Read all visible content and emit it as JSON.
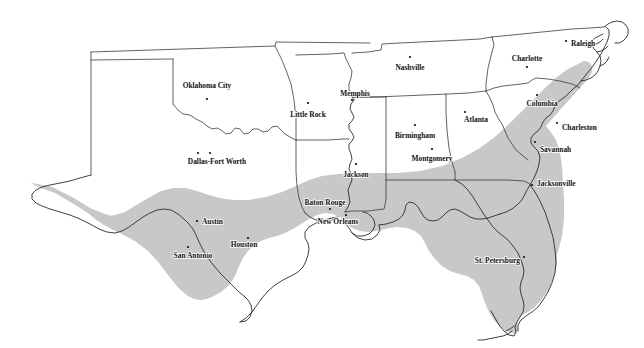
{
  "figure": {
    "type": "reference-map",
    "title_clipped": "partially visible cut-off caption line at top edge",
    "background_color": "#ffffff",
    "shade_color": "#c8c8c8",
    "outline_color": "#3b3b3b",
    "coast_color": "#2c2c2c",
    "label_color": "#111111",
    "region_name": "shaded coastal plain zone",
    "width": 644,
    "height": 348
  },
  "legend": {
    "shaded_area_label": "shaded region",
    "shaded_area_color": "#c8c8c8"
  },
  "cities": [
    {
      "name": "Oklahoma City",
      "x": 207,
      "y": 99,
      "label_x": 207,
      "label_y": 88,
      "anchor": "middle",
      "dots": 1
    },
    {
      "name": "Little Rock",
      "x": 308,
      "y": 103,
      "label_x": 308,
      "label_y": 117,
      "anchor": "middle",
      "dots": 1
    },
    {
      "name": "Dallas-Fort Worth",
      "x": 204,
      "y": 153,
      "label_x": 217,
      "label_y": 164,
      "anchor": "middle",
      "dots": 2
    },
    {
      "name": "Memphis",
      "x": 352,
      "y": 100,
      "label_x": 355,
      "label_y": 96,
      "anchor": "middle",
      "dots": 1
    },
    {
      "name": "Nashville",
      "x": 410,
      "y": 57,
      "label_x": 410,
      "label_y": 70,
      "anchor": "middle",
      "dots": 1
    },
    {
      "name": "Jackson",
      "x": 356,
      "y": 164,
      "label_x": 356,
      "label_y": 177,
      "anchor": "middle",
      "dots": 1
    },
    {
      "name": "Birmingham",
      "x": 415,
      "y": 125,
      "label_x": 415,
      "label_y": 138,
      "anchor": "middle",
      "dots": 1
    },
    {
      "name": "Montgomery",
      "x": 432,
      "y": 149,
      "label_x": 432,
      "label_y": 161,
      "anchor": "middle",
      "dots": 1
    },
    {
      "name": "Atlanta",
      "x": 465,
      "y": 112,
      "label_x": 476,
      "label_y": 122,
      "anchor": "middle",
      "dots": 1
    },
    {
      "name": "Charlotte",
      "x": 527,
      "y": 67,
      "label_x": 527,
      "label_y": 61,
      "anchor": "middle",
      "dots": 1
    },
    {
      "name": "Raleigh",
      "x": 566,
      "y": 41,
      "label_x": 571,
      "label_y": 46,
      "anchor": "start",
      "dots": 1
    },
    {
      "name": "Columbia",
      "x": 537,
      "y": 95,
      "label_x": 542,
      "label_y": 106,
      "anchor": "middle",
      "dots": 1
    },
    {
      "name": "Charleston",
      "x": 557,
      "y": 123,
      "label_x": 562,
      "label_y": 130,
      "anchor": "start",
      "dots": 1
    },
    {
      "name": "Savannah",
      "x": 535,
      "y": 142,
      "label_x": 540,
      "label_y": 152,
      "anchor": "start",
      "dots": 1
    },
    {
      "name": "Jacksonville",
      "x": 532,
      "y": 185,
      "label_x": 537,
      "label_y": 186,
      "anchor": "start",
      "dots": 1
    },
    {
      "name": "St. Petersburg",
      "x": 524,
      "y": 257,
      "label_x": 520,
      "label_y": 263,
      "anchor": "end",
      "dots": 1
    },
    {
      "name": "Baton Rouge",
      "x": 330,
      "y": 209,
      "label_x": 325,
      "label_y": 205,
      "anchor": "middle",
      "dots": 1
    },
    {
      "name": "New Orleans",
      "x": 346,
      "y": 215,
      "label_x": 338,
      "label_y": 224,
      "anchor": "middle",
      "dots": 1
    },
    {
      "name": "Houston",
      "x": 248,
      "y": 238,
      "label_x": 244,
      "label_y": 247,
      "anchor": "middle",
      "dots": 1
    },
    {
      "name": "Austin",
      "x": 197,
      "y": 221,
      "label_x": 202,
      "label_y": 224,
      "anchor": "start",
      "dots": 1
    },
    {
      "name": "San Antonio",
      "x": 188,
      "y": 247,
      "label_x": 193,
      "label_y": 258,
      "anchor": "middle",
      "dots": 1
    }
  ]
}
